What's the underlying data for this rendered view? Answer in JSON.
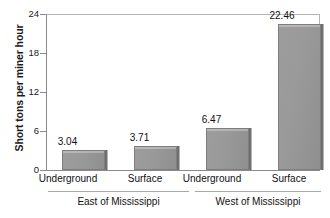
{
  "chart_data": {
    "type": "bar",
    "title": "",
    "xlabel": "",
    "ylabel": "Short tons per miner hour",
    "ylim": [
      0,
      24
    ],
    "yticks": [
      0,
      6,
      12,
      18,
      24
    ],
    "ytick_labels": [
      "0",
      "6",
      "12",
      "18",
      "24"
    ],
    "grid": false,
    "legend": "none",
    "categories": [
      "Underground",
      "Surface",
      "Underground",
      "Surface"
    ],
    "values": [
      3.04,
      3.71,
      6.47,
      22.46
    ],
    "value_labels": [
      "3.04",
      "3.71",
      "6.47",
      "22.46"
    ],
    "groups": [
      {
        "label": "East of Mississippi",
        "categories": [
          "Underground",
          "Surface"
        ],
        "values": [
          3.04,
          3.71
        ]
      },
      {
        "label": "West of Mississippi",
        "categories": [
          "Underground",
          "Surface"
        ],
        "values": [
          6.47,
          22.46
        ]
      }
    ],
    "bar_color": "#9a9a9a",
    "bar_edge_color": "#7e7e7e",
    "bar_shadow_color": "#6f6f6f"
  }
}
